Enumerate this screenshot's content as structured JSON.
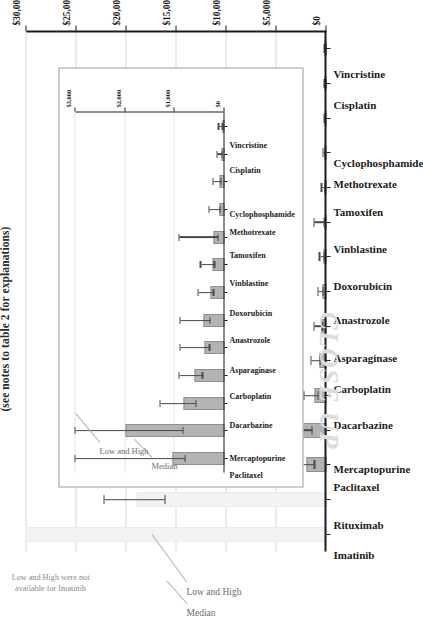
{
  "figure": {
    "title": "(see notes to table 2 for explanations)",
    "watermark": "CLOSE UP"
  },
  "annotations": {
    "median": "Median",
    "low_and_high": "Low and High",
    "imatinib_note_line1": "Low and High were not",
    "imatinib_note_line2": "available for Imatinib",
    "inset_median": "Median",
    "inset_low_and_high": "Low and High"
  },
  "chart_data": [
    {
      "id": "main",
      "type": "bar",
      "title": "(see notes to table 2 for explanations)",
      "xlabel": "",
      "ylabel": "",
      "ylim": [
        0,
        30000
      ],
      "grid": true,
      "legend": null,
      "tick_labels": [
        "$0",
        "$5,000",
        "$10,000",
        "$15,000",
        "$20,000",
        "$25,000",
        "$30,000"
      ],
      "tick_values": [
        0,
        5000,
        10000,
        15000,
        20000,
        25000,
        30000
      ],
      "categories": [
        "Imatinib",
        "Rituximab",
        "Paclitaxel",
        "Mercaptopurine",
        "Dacarbazine",
        "Carboplatin",
        "Asparaginase",
        "Anastrozole",
        "Doxorubicin",
        "Vinblastine",
        "Tamoxifen",
        "Methotrexate",
        "Cyclophosphamide",
        "Cisplatin",
        "Vincristine"
      ],
      "series": [
        {
          "name": "Median",
          "values": [
            32000,
            19000,
            2050,
            2950,
            1180,
            720,
            480,
            400,
            270,
            240,
            150,
            110,
            90,
            60,
            50
          ]
        }
      ],
      "error_low": [
        null,
        16100,
        1150,
        1400,
        760,
        560,
        320,
        300,
        200,
        170,
        110,
        80,
        60,
        45,
        35
      ],
      "error_high": [
        null,
        22200,
        4450,
        4650,
        2250,
        1500,
        1180,
        800,
        620,
        1180,
        430,
        290,
        200,
        150,
        120
      ],
      "notes": "Low and High were not available for Imatinib"
    },
    {
      "id": "inset-close-up",
      "type": "bar",
      "title": "CLOSE UP",
      "xlabel": "",
      "ylabel": "",
      "ylim": [
        0,
        3000
      ],
      "grid": true,
      "legend": null,
      "tick_labels": [
        "$0",
        "$1,000",
        "$2,000",
        "$3,000"
      ],
      "tick_values": [
        0,
        1000,
        2000,
        3000
      ],
      "categories": [
        "Paclitaxel",
        "Mercaptopurine",
        "Dacarbazine",
        "Carboplatin",
        "Asparaginase",
        "Anastrozole",
        "Doxorubicin",
        "Vinblastine",
        "Tamoxifen",
        "Methotrexate",
        "Cyclophosphamide",
        "Cisplatin",
        "Vincristine"
      ],
      "series": [
        {
          "name": "Median",
          "values": [
            1050,
            2000,
            820,
            610,
            400,
            420,
            290,
            250,
            230,
            110,
            95,
            55,
            45
          ]
        }
      ],
      "error_low": [
        780,
        820,
        560,
        430,
        290,
        280,
        210,
        190,
        120,
        80,
        60,
        40,
        30
      ],
      "error_high": [
        3180,
        3040,
        1290,
        900,
        880,
        880,
        520,
        470,
        900,
        300,
        220,
        140,
        110
      ]
    }
  ]
}
